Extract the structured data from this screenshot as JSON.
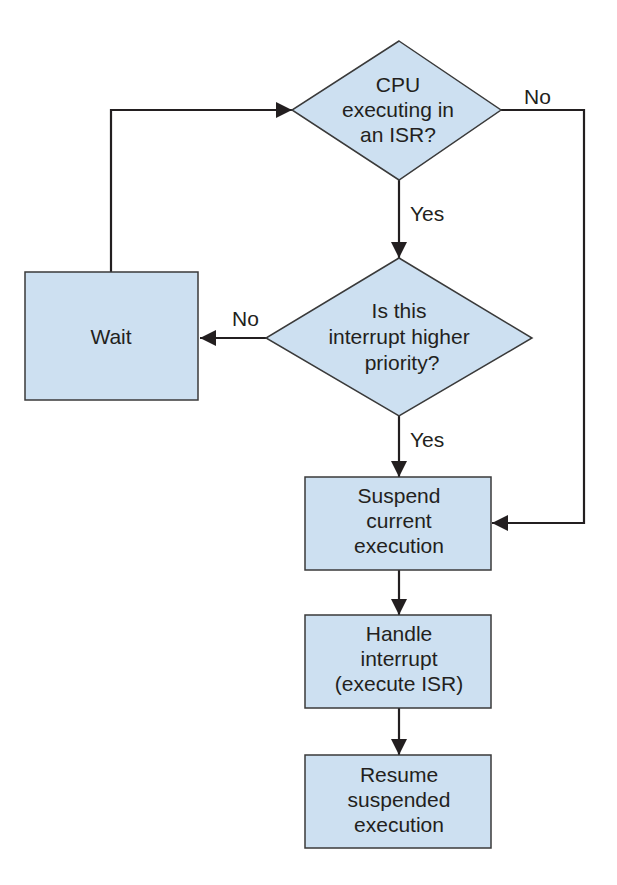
{
  "diagram": {
    "type": "flowchart",
    "colors": {
      "fill": "#cde0f1",
      "stroke": "#3a3a3a",
      "text": "#231f20"
    },
    "nodes": {
      "cpu_in_isr": {
        "shape": "diamond",
        "lines": [
          "CPU",
          "executing in",
          "an ISR?"
        ]
      },
      "higher_priority": {
        "shape": "diamond",
        "lines": [
          "Is this",
          "interrupt higher",
          "priority?"
        ]
      },
      "wait": {
        "shape": "rect",
        "lines": [
          "Wait"
        ]
      },
      "suspend": {
        "shape": "rect",
        "lines": [
          "Suspend",
          "current",
          "execution"
        ]
      },
      "handle": {
        "shape": "rect",
        "lines": [
          "Handle",
          "interrupt",
          "(execute ISR)"
        ]
      },
      "resume": {
        "shape": "rect",
        "lines": [
          "Resume",
          "suspended",
          "execution"
        ]
      }
    },
    "edges": {
      "cpu_yes": {
        "from": "cpu_in_isr",
        "to": "higher_priority",
        "label": "Yes"
      },
      "cpu_no": {
        "from": "cpu_in_isr",
        "to": "suspend",
        "label": "No"
      },
      "prio_yes": {
        "from": "higher_priority",
        "to": "suspend",
        "label": "Yes"
      },
      "prio_no": {
        "from": "higher_priority",
        "to": "wait",
        "label": "No"
      },
      "wait_loop": {
        "from": "wait",
        "to": "cpu_in_isr",
        "label": ""
      },
      "suspend_handle": {
        "from": "suspend",
        "to": "handle",
        "label": ""
      },
      "handle_resume": {
        "from": "handle",
        "to": "resume",
        "label": ""
      }
    }
  }
}
